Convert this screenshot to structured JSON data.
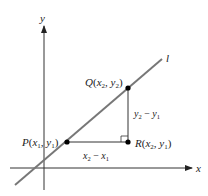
{
  "diagram": {
    "axes": {
      "x_label": "x",
      "y_label": "y"
    },
    "line_label": "l",
    "points": {
      "P": {
        "name": "P",
        "coords": "(x1, y1)"
      },
      "Q": {
        "name": "Q",
        "coords": "(x2, y2)"
      },
      "R": {
        "name": "R",
        "coords": "(x2, y1)"
      }
    },
    "segments": {
      "rise": "y2 − y1",
      "run": "x2 − x1"
    },
    "colors": {
      "line": "#777777",
      "axis": "#333333",
      "point": "#000000"
    }
  }
}
